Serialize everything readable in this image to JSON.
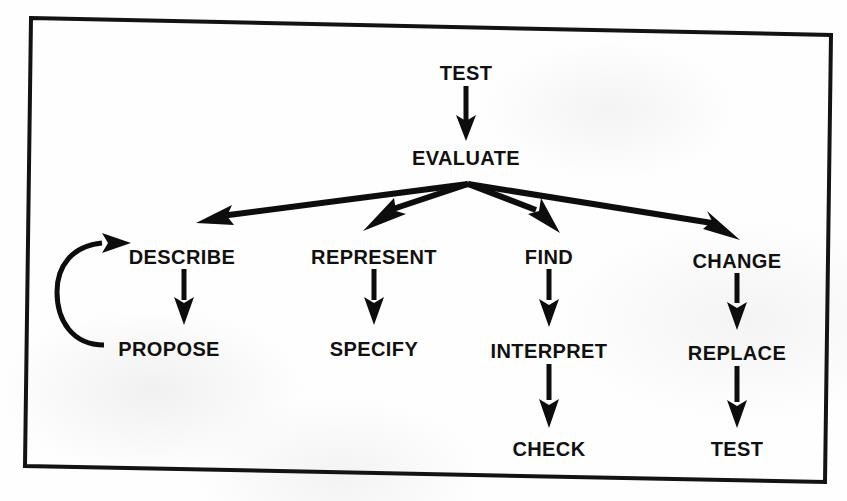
{
  "document": {
    "kind": "scanned-flowchart-figure",
    "background_color": "#fefefe",
    "ink_color": "#0d0d0d"
  },
  "frame": {
    "name": "figure-border",
    "stroke_color": "#131313",
    "stroke_width": 4,
    "corners": {
      "top_left": {
        "x": 31,
        "y": 18
      },
      "top_right": {
        "x": 831,
        "y": 35
      },
      "bottom_right": {
        "x": 825,
        "y": 482
      },
      "bottom_left": {
        "x": 25,
        "y": 466
      }
    }
  },
  "chart_data": {
    "type": "diagram",
    "title": "",
    "subtitle": "",
    "layout": "top-down tree with four branches and one feedback loop",
    "nodes": [
      {
        "id": "test_top",
        "label": "TEST",
        "x": 466,
        "y": 72,
        "row": 0,
        "column": "center"
      },
      {
        "id": "evaluate",
        "label": "EVALUATE",
        "x": 466,
        "y": 157,
        "row": 1,
        "column": "center"
      },
      {
        "id": "describe",
        "label": "DESCRIBE",
        "x": 182,
        "y": 256,
        "row": 2,
        "column": 1
      },
      {
        "id": "represent",
        "label": "REPRESENT",
        "x": 374,
        "y": 256,
        "row": 2,
        "column": 2
      },
      {
        "id": "find",
        "label": "FIND",
        "x": 549,
        "y": 256,
        "row": 2,
        "column": 3
      },
      {
        "id": "change",
        "label": "CHANGE",
        "x": 737,
        "y": 260,
        "row": 2,
        "column": 4
      },
      {
        "id": "propose",
        "label": "PROPOSE",
        "x": 169,
        "y": 348,
        "row": 3,
        "column": 1
      },
      {
        "id": "specify",
        "label": "SPECIFY",
        "x": 374,
        "y": 348,
        "row": 3,
        "column": 2
      },
      {
        "id": "interpret",
        "label": "INTERPRET",
        "x": 549,
        "y": 350,
        "row": 3,
        "column": 3
      },
      {
        "id": "replace",
        "label": "REPLACE",
        "x": 737,
        "y": 352,
        "row": 3,
        "column": 4
      },
      {
        "id": "check",
        "label": "CHECK",
        "x": 549,
        "y": 448,
        "row": 4,
        "column": 3
      },
      {
        "id": "test_bottom",
        "label": "TEST",
        "x": 737,
        "y": 448,
        "row": 4,
        "column": 4
      }
    ],
    "edges": [
      {
        "id": "e1",
        "from": "test_top",
        "to": "evaluate",
        "style": "straight-vertical-arrow"
      },
      {
        "id": "e2",
        "from": "evaluate",
        "to": "describe",
        "style": "fan-branch-arrow"
      },
      {
        "id": "e3",
        "from": "evaluate",
        "to": "represent",
        "style": "fan-branch-arrow"
      },
      {
        "id": "e4",
        "from": "evaluate",
        "to": "find",
        "style": "fan-branch-arrow"
      },
      {
        "id": "e5",
        "from": "evaluate",
        "to": "change",
        "style": "fan-branch-arrow"
      },
      {
        "id": "e6",
        "from": "describe",
        "to": "propose",
        "style": "straight-vertical-arrow"
      },
      {
        "id": "e7",
        "from": "represent",
        "to": "specify",
        "style": "straight-vertical-arrow"
      },
      {
        "id": "e8",
        "from": "find",
        "to": "interpret",
        "style": "straight-vertical-arrow"
      },
      {
        "id": "e9",
        "from": "change",
        "to": "replace",
        "style": "straight-vertical-arrow"
      },
      {
        "id": "e10",
        "from": "interpret",
        "to": "check",
        "style": "straight-vertical-arrow"
      },
      {
        "id": "e11",
        "from": "replace",
        "to": "test_bottom",
        "style": "straight-vertical-arrow"
      },
      {
        "id": "e12",
        "from": "propose",
        "to": "describe",
        "style": "curved-feedback-loop-arrow"
      }
    ],
    "legend": [],
    "annotations": []
  },
  "typography": {
    "node_font_size_px": 20,
    "node_font_weight": "bold"
  }
}
